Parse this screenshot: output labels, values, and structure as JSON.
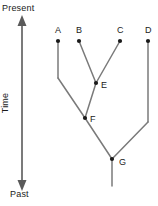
{
  "diagram": {
    "type": "cladogram",
    "colors": {
      "background": "#ffffff",
      "line": "#7a7a7a",
      "node_dot": "#1a1a1a",
      "axis": "#5a5a5a",
      "text": "#1a1a1a"
    },
    "axis": {
      "name": "time-axis",
      "label": "Time",
      "top_label": "Present",
      "bottom_label": "Past",
      "orientation": "vertical",
      "arrow_top": true,
      "arrow_bottom": true
    },
    "tips": [
      {
        "id": "A",
        "label": "A",
        "x": 58,
        "y": 41,
        "label_x": 55,
        "label_y": 33
      },
      {
        "id": "B",
        "label": "B",
        "x": 79,
        "y": 41,
        "label_x": 76,
        "label_y": 33
      },
      {
        "id": "C",
        "label": "C",
        "x": 120,
        "y": 41,
        "label_x": 117,
        "label_y": 33
      },
      {
        "id": "D",
        "label": "D",
        "x": 148,
        "y": 41,
        "label_x": 145,
        "label_y": 33
      }
    ],
    "internal_nodes": [
      {
        "id": "E",
        "label": "E",
        "x": 96,
        "y": 83,
        "label_x": 101,
        "label_y": 88
      },
      {
        "id": "F",
        "label": "F",
        "x": 85,
        "y": 118,
        "label_x": 90,
        "label_y": 122
      },
      {
        "id": "G",
        "label": "G",
        "x": 112,
        "y": 159,
        "label_x": 119,
        "label_y": 165
      }
    ],
    "branches": [
      {
        "name": "branch-B-to-E",
        "points": "79,41 96,83"
      },
      {
        "name": "branch-C-to-E",
        "points": "120,41 96,83"
      },
      {
        "name": "branch-E-to-F",
        "points": "96,83 85,118"
      },
      {
        "name": "branch-A-stem",
        "points": "58,41 58,78"
      },
      {
        "name": "branch-A-to-F",
        "points": "58,78 85,118"
      },
      {
        "name": "branch-F-to-G",
        "points": "85,118 112,159"
      },
      {
        "name": "branch-D-stem",
        "points": "148,41 148,122"
      },
      {
        "name": "branch-D-to-G",
        "points": "148,122 112,159"
      },
      {
        "name": "branch-root-stem",
        "points": "112,159 112,186"
      }
    ]
  }
}
